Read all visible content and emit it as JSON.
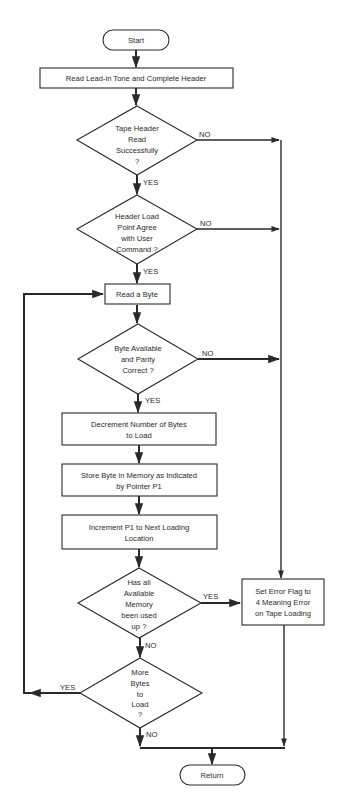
{
  "diagram": {
    "type": "flowchart",
    "nodes": {
      "start": {
        "shape": "terminal",
        "lines": [
          "Start"
        ]
      },
      "read_header": {
        "shape": "process",
        "lines": [
          "Read Lead-in Tone and Complete Header"
        ]
      },
      "header_ok": {
        "shape": "decision",
        "lines": [
          "Tape Header",
          "Read",
          "Successfully",
          "?"
        ]
      },
      "load_point": {
        "shape": "decision",
        "lines": [
          "Header Load",
          "Point Agree",
          "with User",
          "Command ?"
        ]
      },
      "read_byte": {
        "shape": "process",
        "lines": [
          "Read a Byte"
        ]
      },
      "byte_ok": {
        "shape": "decision",
        "lines": [
          "Byte Available",
          "and Parity",
          "Correct ?"
        ]
      },
      "decrement": {
        "shape": "process",
        "lines": [
          "Decrement Number of Bytes",
          "to Load"
        ]
      },
      "store": {
        "shape": "process",
        "lines": [
          "Store Byte in Memory as Indicated",
          "by Pointer P1"
        ]
      },
      "increment": {
        "shape": "process",
        "lines": [
          "Increment P1 to Next Loading",
          "Location"
        ]
      },
      "memory_full": {
        "shape": "decision",
        "lines": [
          "Has all",
          "Available",
          "Memory",
          "been used",
          "up ?"
        ]
      },
      "more_bytes": {
        "shape": "decision",
        "lines": [
          "More",
          "Bytes",
          "to",
          "Load",
          "?"
        ]
      },
      "error_flag": {
        "shape": "process",
        "lines": [
          "Set Error Flag to",
          "4 Meaning Error",
          "on Tape Loading"
        ]
      },
      "return": {
        "shape": "terminal",
        "lines": [
          "Return"
        ]
      }
    },
    "edge_labels": {
      "header_ok_no": "NO",
      "header_ok_yes": "YES",
      "load_point_no": "NO",
      "load_point_yes": "YES",
      "byte_ok_no": "NO",
      "byte_ok_yes": "YES",
      "memory_full_yes": "YES",
      "memory_full_no": "NO",
      "more_bytes_yes": "YES",
      "more_bytes_no": "NO"
    },
    "edges": [
      {
        "from": "start",
        "to": "read_header"
      },
      {
        "from": "read_header",
        "to": "header_ok"
      },
      {
        "from": "header_ok",
        "to": "load_point",
        "label": "YES"
      },
      {
        "from": "header_ok",
        "to": "error_flag",
        "label": "NO"
      },
      {
        "from": "load_point",
        "to": "read_byte",
        "label": "YES"
      },
      {
        "from": "load_point",
        "to": "error_flag",
        "label": "NO"
      },
      {
        "from": "read_byte",
        "to": "byte_ok"
      },
      {
        "from": "byte_ok",
        "to": "decrement",
        "label": "YES"
      },
      {
        "from": "byte_ok",
        "to": "error_flag",
        "label": "NO"
      },
      {
        "from": "decrement",
        "to": "store"
      },
      {
        "from": "store",
        "to": "increment"
      },
      {
        "from": "increment",
        "to": "memory_full"
      },
      {
        "from": "memory_full",
        "to": "error_flag",
        "label": "YES"
      },
      {
        "from": "memory_full",
        "to": "more_bytes",
        "label": "NO"
      },
      {
        "from": "more_bytes",
        "to": "read_byte",
        "label": "YES"
      },
      {
        "from": "more_bytes",
        "to": "return",
        "label": "NO"
      },
      {
        "from": "error_flag",
        "to": "return"
      }
    ]
  }
}
